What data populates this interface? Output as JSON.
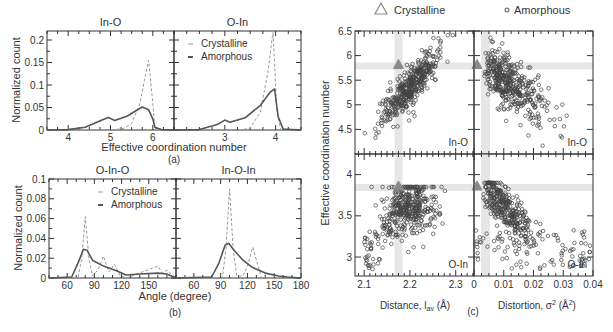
{
  "chart_data": [
    {
      "id": "a",
      "type": "line",
      "caption": "(a)",
      "xlabel": "Effective coordination number",
      "ylabel": "Normalized count",
      "ylim": [
        0,
        0.22
      ],
      "yticks": [
        "0",
        "0.05",
        "0.1",
        "0.15",
        "0.2"
      ],
      "legend": [
        "Crystalline",
        "Amorphous"
      ],
      "panels": [
        {
          "title": "In-O",
          "xlim": [
            3.5,
            6.5
          ],
          "xticks": [
            "4",
            "5",
            "6"
          ],
          "series": [
            {
              "name": "Crystalline",
              "style": "dashed",
              "x": [
                3.5,
                5.0,
                5.3,
                5.5,
                5.7,
                5.8,
                5.9,
                6.0,
                6.05,
                6.2,
                6.5
              ],
              "y": [
                0,
                0,
                0.003,
                0.015,
                0.06,
                0.11,
                0.155,
                0.06,
                0.004,
                0,
                0
              ]
            },
            {
              "name": "Amorphous",
              "style": "solid",
              "x": [
                3.5,
                4.0,
                4.4,
                4.8,
                4.95,
                5.1,
                5.4,
                5.6,
                5.75,
                5.9,
                6.0,
                6.05,
                6.2,
                6.5
              ],
              "y": [
                0,
                0.001,
                0.006,
                0.022,
                0.028,
                0.021,
                0.031,
                0.043,
                0.051,
                0.045,
                0.025,
                0.006,
                0.001,
                0
              ]
            }
          ]
        },
        {
          "title": "O-In",
          "xlim": [
            2.0,
            4.5
          ],
          "xticks": [
            "3",
            "4"
          ],
          "series": [
            {
              "name": "Crystalline",
              "style": "dashed",
              "x": [
                2.0,
                3.3,
                3.5,
                3.7,
                3.85,
                3.95,
                4.02,
                4.1,
                4.5
              ],
              "y": [
                0,
                0,
                0.004,
                0.04,
                0.13,
                0.22,
                0.05,
                0,
                0
              ]
            },
            {
              "name": "Amorphous",
              "style": "solid",
              "x": [
                2.0,
                2.5,
                2.85,
                3.0,
                3.1,
                3.4,
                3.7,
                3.9,
                3.98,
                4.05,
                4.15,
                4.5
              ],
              "y": [
                0,
                0.001,
                0.012,
                0.022,
                0.017,
                0.027,
                0.055,
                0.085,
                0.091,
                0.03,
                0.002,
                0
              ]
            }
          ]
        }
      ]
    },
    {
      "id": "b",
      "type": "line",
      "caption": "(b)",
      "xlabel": "Angle (degree)",
      "ylabel": "Normalized count",
      "ylim": [
        0,
        0.1
      ],
      "yticks": [
        "0",
        "0.02",
        "0.04",
        "0.06",
        "0.08",
        "0.1"
      ],
      "legend": [
        "Crystalline",
        "Amorphous"
      ],
      "panels": [
        {
          "title": "O-In-O",
          "xlim": [
            40,
            180
          ],
          "xticks": [
            "60",
            "90",
            "120",
            "150"
          ],
          "series": [
            {
              "name": "Crystalline",
              "style": "dashed",
              "x": [
                40,
                72,
                76,
                80,
                84,
                88,
                94,
                100,
                106,
                112,
                118,
                125,
                160,
                165,
                170,
                180
              ],
              "y": [
                0,
                0,
                0.02,
                0.062,
                0.02,
                0.002,
                0.008,
                0.022,
                0.006,
                0.014,
                0.003,
                0,
                0.012,
                0.005,
                0.008,
                0
              ]
            },
            {
              "name": "Amorphous",
              "style": "solid",
              "x": [
                40,
                65,
                72,
                78,
                82,
                88,
                100,
                115,
                125,
                140,
                160,
                170,
                180
              ],
              "y": [
                0,
                0.001,
                0.015,
                0.029,
                0.028,
                0.018,
                0.012,
                0.007,
                0.003,
                0.004,
                0.005,
                0.004,
                0
              ]
            }
          ]
        },
        {
          "title": "In-O-In",
          "xlim": [
            40,
            180
          ],
          "xticks": [
            "60",
            "90",
            "120",
            "150",
            "180"
          ],
          "series": [
            {
              "name": "Crystalline",
              "style": "dashed",
              "x": [
                40,
                92,
                96,
                100,
                104,
                108,
                115,
                120,
                126,
                132,
                136,
                180
              ],
              "y": [
                0,
                0,
                0.03,
                0.09,
                0.03,
                0.002,
                0.002,
                0.012,
                0.031,
                0.012,
                0,
                0
              ]
            },
            {
              "name": "Amorphous",
              "style": "solid",
              "x": [
                40,
                80,
                88,
                95,
                99,
                105,
                115,
                125,
                140,
                155,
                165,
                180
              ],
              "y": [
                0,
                0.001,
                0.015,
                0.033,
                0.035,
                0.028,
                0.018,
                0.011,
                0.005,
                0.002,
                0.001,
                0
              ]
            }
          ]
        }
      ]
    },
    {
      "id": "c",
      "type": "scatter",
      "caption": "(c)",
      "ylabel": "Effective coordination number",
      "legend": [
        "Crystalline",
        "Amorphous"
      ],
      "legend_markers": [
        "triangle",
        "circle"
      ],
      "columns": [
        {
          "xlabel": "Distance, l_av (Å)",
          "xlim": [
            2.08,
            2.34
          ],
          "xticks": [
            "2.1",
            "2.2",
            "2.3"
          ]
        },
        {
          "xlabel": "Distortion, σ² (Å²)",
          "xlim": [
            0,
            0.04
          ],
          "xticks": [
            "0",
            "0.01",
            "0.02",
            "0.03",
            "0.04"
          ]
        }
      ],
      "rows": [
        {
          "label": "In-O",
          "ylim": [
            4,
            6.5
          ],
          "yticks": [
            "4.5",
            "5",
            "5.5",
            "6",
            "6.5"
          ],
          "crystalline_point": {
            "distance": 2.175,
            "distortion": 0.001,
            "ecn": 5.8
          },
          "amorphous_trend_distance": "positive correlation, ECN 4.3–6.4 for l_av 2.10–2.30",
          "amorphous_trend_distortion": "negative correlation, ECN 4.3–6.3 for σ² 0–0.035"
        },
        {
          "label": "O-In",
          "ylim": [
            2.77,
            4.25
          ],
          "yticks": [
            "3",
            "3.5",
            "4"
          ],
          "crystalline_point": {
            "distance": 2.175,
            "distortion": 0.001,
            "ecn": 3.85
          },
          "amorphous_trend_distance": "cluster near l_av 2.18–2.25, ECN 3.3–3.85",
          "amorphous_trend_distortion": "negative correlation, ECN 2.8–4.2 for σ² 0–0.038"
        }
      ]
    }
  ],
  "labels": {
    "a_title_left": "In-O",
    "a_title_right": "O-In",
    "a_xlabel": "Effective coordination number",
    "a_caption": "(a)",
    "a_ylabel": "Normalized count",
    "b_title_left": "O-In-O",
    "b_title_right": "In-O-In",
    "b_xlabel": "Angle (degree)",
    "b_caption": "(b)",
    "b_ylabel": "Normalized count",
    "legend_crystalline": "Crystalline",
    "legend_amorphous": "Amorphous",
    "c_ylabel": "Effective coordination number",
    "c_xlabel_left": "Distance, l",
    "c_xlabel_left_sub": "av",
    "c_xlabel_left_unit": " (Å)",
    "c_xlabel_right": "Distortion, σ",
    "c_xlabel_right_sup": "2",
    "c_xlabel_right_unit": " (Å",
    "c_xlabel_right_unit_sup": "2",
    "c_xlabel_right_close": ")",
    "c_caption": "(c)",
    "c_row1_tag": "In-O",
    "c_row2_tag": "O-In"
  },
  "colors": {
    "axis": "#333333",
    "amorphous_line": "#555555",
    "crystalline_line": "#999999",
    "marker_edge": "#444444",
    "crystalline_marker": "#8a8a8a",
    "highlight_band": "#e6e6e6"
  }
}
